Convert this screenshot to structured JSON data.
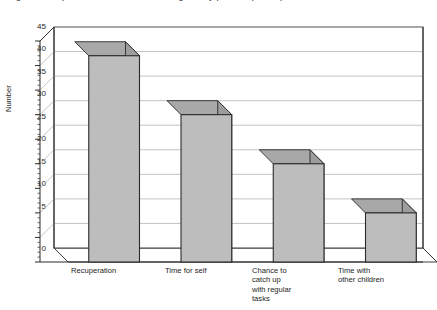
{
  "title": "Figure 3   Respite care: the main reasons given by parents (n = 84)",
  "chart_data": {
    "type": "bar",
    "title": "Figure 3   Respite care: the main reasons given by parents (n = 84)",
    "xlabel": "",
    "ylabel": "Number",
    "categories": [
      "Recuperation",
      "Time for self",
      "Chance to\ncatch up\nwith regular\ntasks",
      "Time with\nother children"
    ],
    "values": [
      42,
      30,
      20,
      10
    ],
    "ylim": [
      0,
      45
    ],
    "yticks": [
      0,
      5,
      10,
      15,
      20,
      25,
      30,
      35,
      40,
      45
    ],
    "ytick_labels": [
      "0",
      "5",
      "10",
      "15",
      "20",
      "25",
      "30",
      "35",
      "40",
      "45"
    ],
    "grid": true,
    "legend": false,
    "style": "3d-column",
    "colors": {
      "bar_front": "#bdbdbd",
      "bar_top": "#a8a8a8",
      "bar_side": "#9d9d9d",
      "bar_edge": "#2b2b2b",
      "grid": "#b4b4b4",
      "axis": "#2b2b2b",
      "floor": "#ffffff",
      "background": "#ffffff"
    }
  },
  "axis": {
    "y_label": "Number"
  }
}
